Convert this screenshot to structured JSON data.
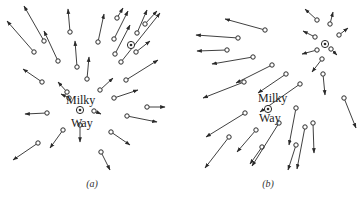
{
  "figure": {
    "panels": [
      {
        "id": "a",
        "caption": "(a)",
        "caption_pos": [
          92,
          187
        ],
        "center_label_top": "Milky",
        "center_label_bottom": "Way",
        "center": [
          80,
          110
        ],
        "label_top_pos": [
          66,
          104
        ],
        "label_bottom_pos": [
          71,
          127
        ],
        "second_galaxy": [
          131,
          45
        ],
        "vectors": [
          [
            34,
            52,
            7,
            21
          ],
          [
            44,
            41,
            24,
            6
          ],
          [
            58,
            61,
            44,
            31
          ],
          [
            70,
            32,
            68,
            9
          ],
          [
            77,
            67,
            75,
            41
          ],
          [
            87,
            79,
            89,
            57
          ],
          [
            42,
            82,
            23,
            69
          ],
          [
            67,
            92,
            58,
            82
          ],
          [
            98,
            42,
            104,
            14
          ],
          [
            117,
            18,
            123,
            8
          ],
          [
            114,
            39,
            128,
            11
          ],
          [
            115,
            54,
            130,
            25
          ],
          [
            137,
            33,
            147,
            10
          ],
          [
            145,
            24,
            157,
            11
          ],
          [
            121,
            62,
            160,
            13
          ],
          [
            136,
            52,
            150,
            41
          ],
          [
            126,
            80,
            158,
            60
          ],
          [
            100,
            90,
            113,
            78
          ],
          [
            114,
            98,
            138,
            90
          ],
          [
            69,
            98,
            61,
            94
          ],
          [
            47,
            113,
            25,
            114
          ],
          [
            94,
            111,
            101,
            114
          ],
          [
            147,
            107,
            165,
            107
          ],
          [
            127,
            116,
            157,
            122
          ],
          [
            111,
            132,
            130,
            145
          ],
          [
            80,
            125,
            80,
            142
          ],
          [
            63,
            130,
            50,
            148
          ],
          [
            38,
            143,
            13,
            160
          ],
          [
            101,
            152,
            110,
            170
          ]
        ]
      },
      {
        "id": "b",
        "caption": "(b)",
        "caption_pos": [
          268,
          187
        ],
        "center_label_top": "Milky",
        "center_label_bottom": "Way",
        "center": [
          268,
          109
        ],
        "label_top_pos": [
          258,
          102
        ],
        "label_bottom_pos": [
          259,
          122
        ],
        "second_galaxy": [
          325,
          44
        ],
        "vectors": [
          [
            265,
            30,
            225,
            19
          ],
          [
            238,
            38,
            196,
            35
          ],
          [
            227,
            50,
            197,
            51
          ],
          [
            253,
            57,
            212,
            64
          ],
          [
            272,
            65,
            236,
            83
          ],
          [
            244,
            82,
            203,
            98
          ],
          [
            286,
            74,
            258,
            93
          ],
          [
            300,
            84,
            260,
            112
          ],
          [
            317,
            20,
            305,
            9
          ],
          [
            330,
            24,
            333,
            12
          ],
          [
            339,
            35,
            348,
            28
          ],
          [
            315,
            37,
            303,
            31
          ],
          [
            317,
            50,
            302,
            54
          ],
          [
            322,
            59,
            312,
            72
          ],
          [
            323,
            74,
            325,
            95
          ],
          [
            331,
            49,
            337,
            55
          ],
          [
            245,
            113,
            206,
            137
          ],
          [
            256,
            130,
            237,
            152
          ],
          [
            262,
            147,
            250,
            164
          ],
          [
            229,
            137,
            205,
            168
          ],
          [
            279,
            123,
            252,
            166
          ],
          [
            296,
            108,
            289,
            145
          ],
          [
            313,
            123,
            314,
            153
          ],
          [
            305,
            127,
            297,
            169
          ],
          [
            296,
            145,
            288,
            170
          ],
          [
            344,
            98,
            356,
            128
          ]
        ]
      }
    ],
    "stroke_color": "#2a2a2a",
    "background": "#ffffff"
  }
}
